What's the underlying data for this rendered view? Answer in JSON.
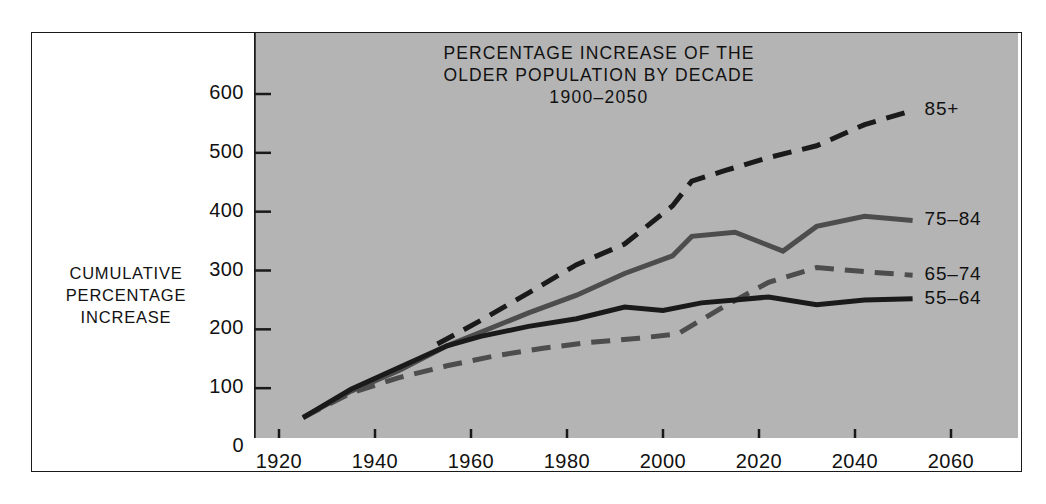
{
  "chart_data": {
    "type": "line",
    "title": "PERCENTAGE INCREASE OF THE OLDER POPULATION BY DECADE",
    "title_line1": "PERCENTAGE INCREASE OF THE",
    "title_line2": "OLDER POPULATION BY DECADE",
    "subtitle": "1900–2050",
    "xlabel": "",
    "ylabel": "CUMULATIVE PERCENTAGE INCREASE",
    "ylabel_line1": "CUMULATIVE",
    "ylabel_line2": "PERCENTAGE",
    "ylabel_line3": "INCREASE",
    "xlim": [
      1915,
      2070
    ],
    "ylim": [
      0,
      640
    ],
    "grid": false,
    "legend_position": "right-inline",
    "yticks": [
      0,
      100,
      200,
      300,
      400,
      500,
      600
    ],
    "ytick_labels": [
      "0",
      "100",
      "200",
      "300",
      "400",
      "500",
      "600"
    ],
    "xticks": [
      1920,
      1940,
      1960,
      1980,
      2000,
      2020,
      2040,
      2060
    ],
    "xtick_labels": [
      "1920",
      "1940",
      "1960",
      "1980",
      "2000",
      "2020",
      "2040",
      "2060"
    ],
    "series": [
      {
        "name": "85+",
        "label": "85+",
        "style": "dashed",
        "color": "#1a1a1a",
        "width": 5,
        "x": [
          1953,
          1962,
          1972,
          1982,
          1992,
          2002,
          2006,
          2013,
          2022,
          2032,
          2042,
          2052
        ],
        "values": [
          175,
          215,
          262,
          310,
          345,
          410,
          452,
          470,
          492,
          512,
          548,
          572
        ]
      },
      {
        "name": "75-84",
        "label": "75–84",
        "style": "solid",
        "color": "#4d4d4d",
        "width": 5,
        "x": [
          1925,
          1935,
          1945,
          1955,
          1962,
          1972,
          1982,
          1992,
          2002,
          2006,
          2015,
          2025,
          2032,
          2042,
          2052
        ],
        "values": [
          50,
          95,
          130,
          172,
          195,
          228,
          258,
          295,
          325,
          358,
          365,
          333,
          375,
          392,
          385
        ]
      },
      {
        "name": "65-74",
        "label": "65–74",
        "style": "dashed",
        "color": "#4d4d4d",
        "width": 5,
        "x": [
          1925,
          1935,
          1945,
          1955,
          1965,
          1975,
          1985,
          1995,
          2003,
          2013,
          2022,
          2032,
          2042,
          2052
        ],
        "values": [
          50,
          92,
          118,
          138,
          155,
          168,
          178,
          185,
          192,
          240,
          280,
          305,
          298,
          292
        ]
      },
      {
        "name": "55-64",
        "label": "55–64",
        "style": "solid",
        "color": "#1a1a1a",
        "width": 5,
        "x": [
          1925,
          1935,
          1945,
          1955,
          1962,
          1972,
          1982,
          1992,
          2000,
          2008,
          2015,
          2022,
          2032,
          2042,
          2052
        ],
        "values": [
          50,
          98,
          135,
          172,
          188,
          205,
          218,
          238,
          232,
          245,
          250,
          255,
          242,
          250,
          252
        ]
      }
    ]
  },
  "colors": {
    "panel_background": "#b4b4b4",
    "page_background": "#ffffff",
    "axis": "#1a1a1a",
    "text": "#111111"
  }
}
